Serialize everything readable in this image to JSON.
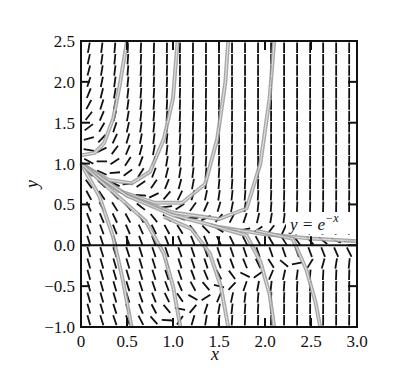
{
  "chart_data": {
    "type": "line",
    "subtype": "slope-field",
    "title": "",
    "xlabel": "x",
    "ylabel": "y",
    "xlim": [
      0,
      3.0
    ],
    "ylim": [
      -1.0,
      2.5
    ],
    "x_ticks": [
      0,
      0.5,
      1.0,
      1.5,
      2.0,
      2.5,
      3.0
    ],
    "x_tick_labels": [
      "0",
      "0.5",
      "1.0",
      "1.5",
      "2.0",
      "2.5",
      "3.0"
    ],
    "y_ticks": [
      -1.0,
      -0.5,
      0.0,
      0.5,
      1.0,
      1.5,
      2.0,
      2.5
    ],
    "y_tick_labels": [
      "−1.0",
      "−0.5",
      "0.0",
      "0.5",
      "1.0",
      "1.5",
      "2.0",
      "2.5"
    ],
    "grid": false,
    "zero_line": true,
    "annotation": {
      "text_main": "y = e",
      "text_sup": "−x",
      "x": 2.25,
      "y": 0.25
    },
    "highlighted_solution": "y = e^(-x)",
    "slope_field": {
      "columns": 21,
      "rows": 25,
      "dash_color": "#111111"
    },
    "solution_curves": [
      {
        "name": "upper-1",
        "points": [
          [
            0,
            1.1
          ],
          [
            0.15,
            1.13
          ],
          [
            0.25,
            1.25
          ],
          [
            0.35,
            1.55
          ],
          [
            0.42,
            1.95
          ],
          [
            0.5,
            2.5
          ]
        ]
      },
      {
        "name": "upper-2",
        "points": [
          [
            0,
            1.0
          ],
          [
            0.3,
            0.8
          ],
          [
            0.55,
            0.76
          ],
          [
            0.75,
            0.9
          ],
          [
            0.9,
            1.3
          ],
          [
            1.0,
            1.8
          ],
          [
            1.05,
            2.5
          ]
        ]
      },
      {
        "name": "upper-3",
        "points": [
          [
            0,
            1.0
          ],
          [
            0.4,
            0.67
          ],
          [
            0.8,
            0.52
          ],
          [
            1.1,
            0.52
          ],
          [
            1.35,
            0.75
          ],
          [
            1.48,
            1.3
          ],
          [
            1.57,
            2.0
          ],
          [
            1.6,
            2.5
          ]
        ]
      },
      {
        "name": "upper-4",
        "points": [
          [
            0,
            1.0
          ],
          [
            0.5,
            0.61
          ],
          [
            1.0,
            0.4
          ],
          [
            1.5,
            0.32
          ],
          [
            1.8,
            0.45
          ],
          [
            1.95,
            1.0
          ],
          [
            2.05,
            1.8
          ],
          [
            2.1,
            2.5
          ]
        ]
      },
      {
        "name": "exp-solution",
        "points": [
          [
            0,
            1.0
          ],
          [
            0.5,
            0.607
          ],
          [
            1.0,
            0.368
          ],
          [
            1.5,
            0.223
          ],
          [
            2.0,
            0.135
          ],
          [
            2.5,
            0.082
          ],
          [
            3.0,
            0.05
          ]
        ]
      },
      {
        "name": "lower-1",
        "points": [
          [
            0,
            1.0
          ],
          [
            0.2,
            0.6
          ],
          [
            0.35,
            0.1
          ],
          [
            0.45,
            -0.4
          ],
          [
            0.55,
            -1.0
          ]
        ]
      },
      {
        "name": "lower-2",
        "points": [
          [
            0,
            1.0
          ],
          [
            0.4,
            0.6
          ],
          [
            0.7,
            0.3
          ],
          [
            0.9,
            -0.1
          ],
          [
            1.0,
            -0.5
          ],
          [
            1.08,
            -1.0
          ]
        ]
      },
      {
        "name": "lower-3",
        "points": [
          [
            0.9,
            0.35
          ],
          [
            1.2,
            0.2
          ],
          [
            1.4,
            -0.1
          ],
          [
            1.52,
            -0.5
          ],
          [
            1.6,
            -1.0
          ]
        ]
      },
      {
        "name": "lower-4",
        "points": [
          [
            1.4,
            0.25
          ],
          [
            1.8,
            0.12
          ],
          [
            1.95,
            -0.2
          ],
          [
            2.05,
            -0.6
          ],
          [
            2.1,
            -1.0
          ]
        ]
      },
      {
        "name": "lower-5",
        "points": [
          [
            1.9,
            0.18
          ],
          [
            2.3,
            0.08
          ],
          [
            2.45,
            -0.3
          ],
          [
            2.55,
            -0.7
          ],
          [
            2.6,
            -1.0
          ]
        ]
      }
    ],
    "curve_color": "#9a9a9a"
  }
}
